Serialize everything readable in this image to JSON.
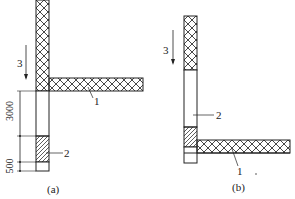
{
  "diagram": {
    "panel_a": {
      "caption": "(a)",
      "arrow_label": "3",
      "slab_label": "1",
      "block_label": "2",
      "dim_upper": "3000",
      "dim_lower": "500"
    },
    "panel_b": {
      "caption": "(b)",
      "arrow_label": "3",
      "slab_label": "1",
      "block_label": "2"
    },
    "colors": {
      "line": "#222222",
      "background": "#ffffff"
    }
  }
}
